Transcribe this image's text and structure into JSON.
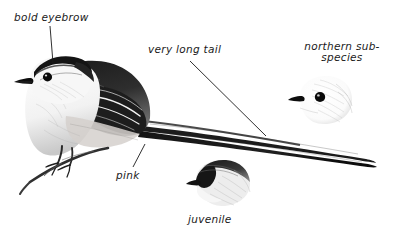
{
  "figure": {
    "background_color": "#ffffff",
    "ink_color": "#111111",
    "style": "pen-and-ink field guide sketch"
  },
  "annotations": [
    {
      "id": "bold-eyebrow",
      "text": "bold eyebrow",
      "lines": [
        "bold eyebrow"
      ],
      "x": 14,
      "y": 12,
      "leader": {
        "x1": 50,
        "y1": 26,
        "x2": 53,
        "y2": 63
      }
    },
    {
      "id": "very-long-tail",
      "text": "very long tail",
      "lines": [
        "very long tail"
      ],
      "x": 148,
      "y": 44,
      "leader": {
        "x1": 190,
        "y1": 61,
        "x2": 266,
        "y2": 136
      }
    },
    {
      "id": "northern-subspecies",
      "text": "northern sub-species",
      "lines": [
        "northern sub-",
        "species"
      ],
      "x": 300,
      "y": 41,
      "leader": null
    },
    {
      "id": "pink",
      "text": "pink",
      "lines": [
        "pink"
      ],
      "x": 116,
      "y": 170,
      "leader": {
        "x1": 145,
        "y1": 144,
        "x2": 133,
        "y2": 167
      }
    },
    {
      "id": "juvenile",
      "text": "juvenile",
      "lines": [
        "juvenile"
      ],
      "x": 188,
      "y": 214,
      "leader": null
    }
  ],
  "illustrations": [
    {
      "id": "main-bird",
      "name": "adult long-tailed tit perched on twig",
      "x": 8,
      "y": 52,
      "width": 370,
      "height": 135
    },
    {
      "id": "northern-head",
      "name": "northern subspecies head, all white",
      "x": 292,
      "y": 78,
      "width": 58,
      "height": 50
    },
    {
      "id": "juvenile-head",
      "name": "juvenile head, dark face pale throat",
      "x": 186,
      "y": 158,
      "width": 64,
      "height": 50
    }
  ]
}
